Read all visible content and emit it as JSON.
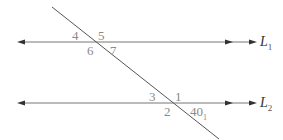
{
  "diagram": {
    "type": "parallel-lines-transversal",
    "lines": [
      {
        "id": "L1",
        "name": "L",
        "subscript": "1",
        "y": 42
      },
      {
        "id": "L2",
        "name": "L",
        "subscript": "2",
        "y": 103
      }
    ],
    "angle_labels": {
      "a4": "4",
      "a5": "5",
      "a6": "6",
      "a7": "7",
      "a3": "3",
      "a1": "1",
      "a2": "2",
      "a40": "40",
      "a40_suffix": "1"
    },
    "colors": {
      "line": "#555555",
      "label": "#8a8a8a",
      "name": "#333333"
    }
  }
}
